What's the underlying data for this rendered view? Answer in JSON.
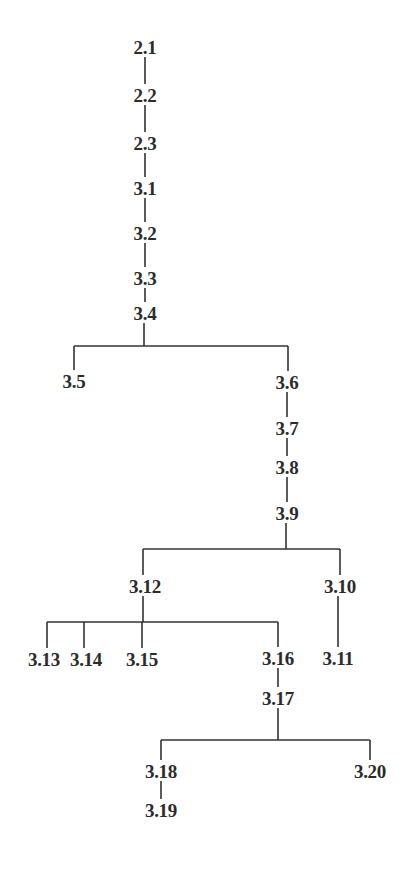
{
  "diagram": {
    "type": "tree",
    "title": "",
    "colors": {
      "line": "#333333",
      "text": "#2b2b2b",
      "background": "#ffffff"
    },
    "nodes": [
      {
        "id": "2.1",
        "label": "2.1",
        "x": 145,
        "y": 47
      },
      {
        "id": "2.2",
        "label": "2.2",
        "x": 145,
        "y": 95
      },
      {
        "id": "2.3",
        "label": "2.3",
        "x": 145,
        "y": 143
      },
      {
        "id": "3.1",
        "label": "3.1",
        "x": 145,
        "y": 188
      },
      {
        "id": "3.2",
        "label": "3.2",
        "x": 145,
        "y": 233
      },
      {
        "id": "3.3",
        "label": "3.3",
        "x": 145,
        "y": 278
      },
      {
        "id": "3.4",
        "label": "3.4",
        "x": 145,
        "y": 313
      },
      {
        "id": "3.5",
        "label": "3.5",
        "x": 74,
        "y": 381
      },
      {
        "id": "3.6",
        "label": "3.6",
        "x": 287,
        "y": 382
      },
      {
        "id": "3.7",
        "label": "3.7",
        "x": 287,
        "y": 428
      },
      {
        "id": "3.8",
        "label": "3.8",
        "x": 287,
        "y": 467
      },
      {
        "id": "3.9",
        "label": "3.9",
        "x": 287,
        "y": 513
      },
      {
        "id": "3.12",
        "label": "3.12",
        "x": 145,
        "y": 586
      },
      {
        "id": "3.10",
        "label": "3.10",
        "x": 340,
        "y": 586
      },
      {
        "id": "3.13",
        "label": "3.13",
        "x": 44,
        "y": 659
      },
      {
        "id": "3.14",
        "label": "3.14",
        "x": 86,
        "y": 659
      },
      {
        "id": "3.15",
        "label": "3.15",
        "x": 142,
        "y": 659
      },
      {
        "id": "3.16",
        "label": "3.16",
        "x": 278,
        "y": 658
      },
      {
        "id": "3.11",
        "label": "3.11",
        "x": 338,
        "y": 658
      },
      {
        "id": "3.17",
        "label": "3.17",
        "x": 278,
        "y": 698
      },
      {
        "id": "3.18",
        "label": "3.18",
        "x": 161,
        "y": 771
      },
      {
        "id": "3.20",
        "label": "3.20",
        "x": 370,
        "y": 771
      },
      {
        "id": "3.19",
        "label": "3.19",
        "x": 161,
        "y": 810
      }
    ],
    "edges": [
      {
        "from": "2.1",
        "to": "2.2"
      },
      {
        "from": "2.2",
        "to": "2.3"
      },
      {
        "from": "2.3",
        "to": "3.1"
      },
      {
        "from": "3.1",
        "to": "3.2"
      },
      {
        "from": "3.2",
        "to": "3.3"
      },
      {
        "from": "3.3",
        "to": "3.4"
      },
      {
        "from": "3.4",
        "to": "3.5"
      },
      {
        "from": "3.4",
        "to": "3.6"
      },
      {
        "from": "3.6",
        "to": "3.7"
      },
      {
        "from": "3.7",
        "to": "3.8"
      },
      {
        "from": "3.8",
        "to": "3.9"
      },
      {
        "from": "3.9",
        "to": "3.12"
      },
      {
        "from": "3.9",
        "to": "3.10"
      },
      {
        "from": "3.10",
        "to": "3.11"
      },
      {
        "from": "3.12",
        "to": "3.13"
      },
      {
        "from": "3.12",
        "to": "3.14"
      },
      {
        "from": "3.12",
        "to": "3.15"
      },
      {
        "from": "3.12",
        "to": "3.16"
      },
      {
        "from": "3.16",
        "to": "3.17"
      },
      {
        "from": "3.17",
        "to": "3.18"
      },
      {
        "from": "3.17",
        "to": "3.20"
      },
      {
        "from": "3.18",
        "to": "3.19"
      }
    ],
    "bracket_segments": [
      {
        "name": "trunk-2.1-2.2",
        "x1": 145,
        "y1": 57,
        "x2": 145,
        "y2": 84
      },
      {
        "name": "trunk-2.2-2.3",
        "x1": 145,
        "y1": 105,
        "x2": 145,
        "y2": 132
      },
      {
        "name": "trunk-2.3-3.1",
        "x1": 145,
        "y1": 153,
        "x2": 145,
        "y2": 177
      },
      {
        "name": "trunk-3.1-3.2",
        "x1": 145,
        "y1": 198,
        "x2": 145,
        "y2": 222
      },
      {
        "name": "trunk-3.2-3.3",
        "x1": 145,
        "y1": 243,
        "x2": 145,
        "y2": 267
      },
      {
        "name": "trunk-3.3-3.4",
        "x1": 145,
        "y1": 288,
        "x2": 145,
        "y2": 302
      },
      {
        "name": "stem-3.4",
        "x1": 144,
        "y1": 323,
        "x2": 144,
        "y2": 346
      },
      {
        "name": "bar-3.4",
        "x1": 74,
        "y1": 346,
        "x2": 288,
        "y2": 346
      },
      {
        "name": "drop-3.5",
        "x1": 74,
        "y1": 346,
        "x2": 74,
        "y2": 370
      },
      {
        "name": "drop-3.6",
        "x1": 288,
        "y1": 346,
        "x2": 288,
        "y2": 371
      },
      {
        "name": "chain-3.6-3.7",
        "x1": 287,
        "y1": 392,
        "x2": 287,
        "y2": 417
      },
      {
        "name": "chain-3.7-3.8",
        "x1": 287,
        "y1": 438,
        "x2": 287,
        "y2": 456
      },
      {
        "name": "chain-3.8-3.9",
        "x1": 287,
        "y1": 477,
        "x2": 287,
        "y2": 502
      },
      {
        "name": "stem-3.9",
        "x1": 286,
        "y1": 523,
        "x2": 286,
        "y2": 549
      },
      {
        "name": "bar-3.9",
        "x1": 143,
        "y1": 549,
        "x2": 340,
        "y2": 549
      },
      {
        "name": "drop-3.12",
        "x1": 143,
        "y1": 549,
        "x2": 143,
        "y2": 575
      },
      {
        "name": "drop-3.10",
        "x1": 340,
        "y1": 549,
        "x2": 340,
        "y2": 575
      },
      {
        "name": "chain-3.10-3.11",
        "x1": 338,
        "y1": 596,
        "x2": 338,
        "y2": 647
      },
      {
        "name": "stem-3.12",
        "x1": 143,
        "y1": 596,
        "x2": 143,
        "y2": 622
      },
      {
        "name": "bar-3.12",
        "x1": 47,
        "y1": 622,
        "x2": 278,
        "y2": 622
      },
      {
        "name": "drop-3.13",
        "x1": 47,
        "y1": 622,
        "x2": 47,
        "y2": 648
      },
      {
        "name": "drop-3.14",
        "x1": 84,
        "y1": 622,
        "x2": 84,
        "y2": 648
      },
      {
        "name": "drop-3.15",
        "x1": 142,
        "y1": 622,
        "x2": 142,
        "y2": 648
      },
      {
        "name": "drop-3.16",
        "x1": 278,
        "y1": 622,
        "x2": 278,
        "y2": 647
      },
      {
        "name": "chain-3.16-3.17",
        "x1": 278,
        "y1": 668,
        "x2": 278,
        "y2": 687
      },
      {
        "name": "stem-3.17",
        "x1": 278,
        "y1": 708,
        "x2": 278,
        "y2": 740
      },
      {
        "name": "bar-3.17",
        "x1": 161,
        "y1": 740,
        "x2": 370,
        "y2": 740
      },
      {
        "name": "drop-3.18",
        "x1": 161,
        "y1": 740,
        "x2": 161,
        "y2": 760
      },
      {
        "name": "drop-3.20",
        "x1": 370,
        "y1": 740,
        "x2": 370,
        "y2": 760
      },
      {
        "name": "chain-3.18-3.19",
        "x1": 161,
        "y1": 781,
        "x2": 161,
        "y2": 799
      }
    ]
  }
}
